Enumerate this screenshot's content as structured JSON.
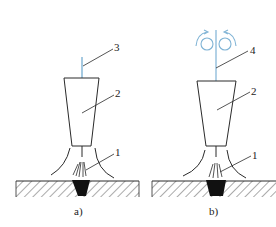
{
  "figure": {
    "colors": {
      "line": "#2a2a2a",
      "electrode": "#7fb3d5",
      "rollers": "#7fb3d5",
      "weld_pool": "#111111",
      "background": "#ffffff"
    },
    "panels": [
      {
        "caption": "a)",
        "labels": [
          {
            "text": "3",
            "refers_to": "electrode"
          },
          {
            "text": "2",
            "refers_to": "torch-nozzle"
          },
          {
            "text": "1",
            "refers_to": "arc"
          }
        ]
      },
      {
        "caption": "b)",
        "labels": [
          {
            "text": "4",
            "refers_to": "wire-electrode"
          },
          {
            "text": "2",
            "refers_to": "torch-nozzle"
          },
          {
            "text": "1",
            "refers_to": "arc"
          }
        ]
      }
    ]
  }
}
